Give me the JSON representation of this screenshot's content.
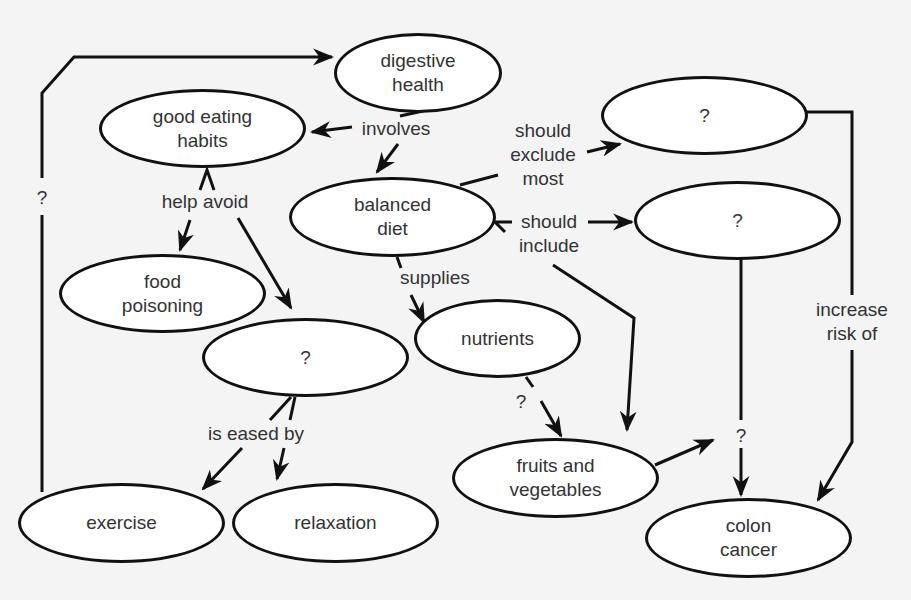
{
  "diagram": {
    "type": "concept-map",
    "nodes": [
      {
        "id": "digestive_health",
        "label": "digestive\nhealth"
      },
      {
        "id": "good_eating_habits",
        "label": "good eating\nhabits"
      },
      {
        "id": "balanced_diet",
        "label": "balanced\ndiet"
      },
      {
        "id": "unknown_exclude",
        "label": "?"
      },
      {
        "id": "unknown_include",
        "label": "?"
      },
      {
        "id": "food_poisoning",
        "label": "food\npoisoning"
      },
      {
        "id": "nutrients",
        "label": "nutrients"
      },
      {
        "id": "unknown_avoid",
        "label": "?"
      },
      {
        "id": "fruits_vegetables",
        "label": "fruits and\nvegetables"
      },
      {
        "id": "exercise",
        "label": "exercise"
      },
      {
        "id": "relaxation",
        "label": "relaxation"
      },
      {
        "id": "colon_cancer",
        "label": "colon\ncancer"
      }
    ],
    "edge_labels": {
      "involves": "involves",
      "help_avoid": "help avoid",
      "should_exclude_most": "should\nexclude\nmost",
      "should_include": "should\ninclude",
      "supplies": "supplies",
      "is_eased_by": "is eased by",
      "increase_risk_of": "increase\nrisk of",
      "unknown_left": "?",
      "unknown_nutrients": "?",
      "unknown_colon": "?"
    },
    "edges": [
      {
        "from": "digestive_health",
        "to": "good_eating_habits",
        "label": "involves"
      },
      {
        "from": "digestive_health",
        "to": "balanced_diet",
        "label": "involves"
      },
      {
        "from": "good_eating_habits",
        "to": "food_poisoning",
        "label": "help avoid"
      },
      {
        "from": "good_eating_habits",
        "to": "unknown_avoid",
        "label": "help avoid"
      },
      {
        "from": "balanced_diet",
        "to": "unknown_exclude",
        "label": "should exclude most"
      },
      {
        "from": "balanced_diet",
        "to": "unknown_include",
        "label": "should include"
      },
      {
        "from": "balanced_diet",
        "to": "fruits_vegetables",
        "label": "should include"
      },
      {
        "from": "balanced_diet",
        "to": "nutrients",
        "label": "supplies"
      },
      {
        "from": "nutrients",
        "to": "fruits_vegetables",
        "label": "?"
      },
      {
        "from": "unknown_avoid",
        "to": "exercise",
        "label": "is eased by"
      },
      {
        "from": "unknown_avoid",
        "to": "relaxation",
        "label": "is eased by"
      },
      {
        "from": "exercise",
        "to": "digestive_health",
        "label": "?"
      },
      {
        "from": "unknown_exclude",
        "to": "colon_cancer",
        "label": "increase risk of"
      },
      {
        "from": "unknown_include",
        "to": "colon_cancer",
        "label": "?"
      },
      {
        "from": "fruits_vegetables",
        "to": "colon_cancer",
        "label": "?"
      }
    ]
  }
}
